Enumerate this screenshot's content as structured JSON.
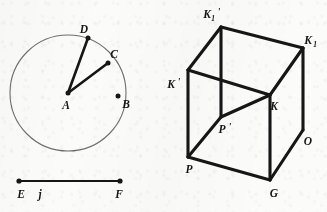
{
  "figure": {
    "background_color": "#fbfbfa",
    "ink_color": "#161616",
    "circle_stroke_color": "#6f6f6f"
  },
  "circle_figure": {
    "name": "circle-with-radii",
    "center": {
      "label": "A",
      "x": 68,
      "y": 93
    },
    "radius": 58,
    "points": [
      {
        "label": "B",
        "x": 118,
        "y": 96,
        "label_x": 124,
        "label_y": 108
      },
      {
        "label": "C",
        "x": 108,
        "y": 63,
        "label_x": 112,
        "label_y": 58
      },
      {
        "label": "D",
        "x": 88,
        "y": 38,
        "label_x": 84,
        "label_y": 33
      }
    ],
    "center_label_x": 66,
    "center_label_y": 109,
    "radii": [
      {
        "from": "A",
        "to": "C"
      },
      {
        "from": "A",
        "to": "D"
      }
    ]
  },
  "segment_figure": {
    "name": "segment-ef",
    "label": "j",
    "label_x": 40,
    "label_y": 198,
    "endpoints": [
      {
        "label": "E",
        "x": 19,
        "y": 181,
        "label_x": 21,
        "label_y": 198
      },
      {
        "label": "F",
        "x": 120,
        "y": 181,
        "label_x": 117,
        "label_y": 198
      }
    ]
  },
  "cube_figure": {
    "name": "cube-diagram",
    "vertices": [
      {
        "label": "K_1'",
        "base": "K",
        "sub": "1",
        "prime": "'",
        "x": 221,
        "y": 27,
        "label_x": 208,
        "label_y": 18
      },
      {
        "label": "K_1",
        "base": "K",
        "sub": "1",
        "prime": "",
        "x": 303,
        "y": 48,
        "label_x": 306,
        "label_y": 44
      },
      {
        "label": "K'",
        "base": "K",
        "sub": "",
        "prime": "'",
        "x": 188,
        "y": 70,
        "label_x": 167,
        "label_y": 88
      },
      {
        "label": "K",
        "base": "K",
        "sub": "",
        "prime": "",
        "x": 270,
        "y": 95,
        "label_x": 272,
        "label_y": 110
      },
      {
        "label": "P'",
        "base": "P",
        "sub": "",
        "prime": "'",
        "x": 221,
        "y": 117,
        "label_x": 223,
        "label_y": 133
      },
      {
        "label": "P",
        "base": "P",
        "sub": "",
        "prime": "",
        "x": 188,
        "y": 157,
        "label_x": 188,
        "label_y": 172
      },
      {
        "label": "G",
        "base": "G",
        "sub": "",
        "prime": "",
        "x": 270,
        "y": 180,
        "label_x": 272,
        "label_y": 196
      },
      {
        "label": "O",
        "base": "O",
        "sub": "",
        "prime": "",
        "x": 303,
        "y": 130,
        "label_x": 306,
        "label_y": 145
      }
    ],
    "edges": [
      {
        "from": "K_1'",
        "to": "K_1"
      },
      {
        "from": "K_1'",
        "to": "K'"
      },
      {
        "from": "K_1'",
        "to": "P'"
      },
      {
        "from": "K_1",
        "to": "K"
      },
      {
        "from": "K_1",
        "to": "O"
      },
      {
        "from": "K'",
        "to": "K"
      },
      {
        "from": "K'",
        "to": "P"
      },
      {
        "from": "K",
        "to": "G"
      },
      {
        "from": "P'",
        "to": "K"
      },
      {
        "from": "P'",
        "to": "P"
      },
      {
        "from": "P",
        "to": "G"
      },
      {
        "from": "G",
        "to": "O"
      },
      {
        "from": "O",
        "to": "K"
      }
    ]
  }
}
